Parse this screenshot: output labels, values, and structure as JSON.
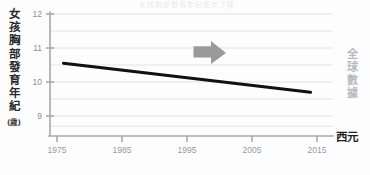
{
  "figure": {
    "title_faint": "女孩胸部發育年紀逐年下降",
    "y_axis_title_chars": [
      "女",
      "孩",
      "胸",
      "部",
      "發",
      "育",
      "年",
      "紀"
    ],
    "y_axis_unit": "(歲)",
    "x_axis_title": "西元",
    "side_note_chars": [
      "全",
      "球",
      "數",
      "據"
    ],
    "arrow_icon": "right-arrow-icon"
  },
  "colors": {
    "trend_line": "#111111",
    "arrow": "#9a9a9a",
    "gridline": "#e2e2e4",
    "axis": "#a8a8ad",
    "tick_text": "#93939a",
    "side_note_text": "#b9b9bd",
    "axis_title_text": "#242424",
    "background": "#fdfdfd"
  },
  "chart_data": {
    "type": "line",
    "title": "女孩胸部發育年紀逐年下降",
    "xlabel": "西元",
    "ylabel": "女孩胸部發育年紀 (歲)",
    "ylim": [
      8.5,
      12
    ],
    "xlim": [
      1973,
      2017
    ],
    "grid": true,
    "grid_y_step": 0.5,
    "legend": "none",
    "y_ticks": [
      12,
      11,
      10,
      9
    ],
    "y_gridlines": [
      12,
      11.5,
      11,
      10.5,
      10,
      9.5,
      9,
      8.7
    ],
    "x_ticks": [
      1975,
      1985,
      1995,
      2005,
      2015
    ],
    "series": [
      {
        "name": "女孩胸部發育年紀",
        "x": [
          1976,
          2014
        ],
        "values": [
          10.55,
          9.7
        ]
      }
    ],
    "annotations": [
      {
        "type": "arrow",
        "direction": "right",
        "x_start": 1996,
        "x_end": 2001,
        "y": 10.9,
        "color": "#9a9a9a"
      }
    ]
  }
}
